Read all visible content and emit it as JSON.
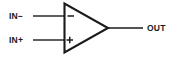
{
  "diagram": {
    "type": "schematic-symbol",
    "component": "operational-amplifier",
    "stroke_color": "#1a1a1a",
    "background_color": "#ffffff",
    "labels": {
      "inverting_input": "IN−",
      "noninverting_input": "IN+",
      "output": "OUT"
    },
    "terminal_marks": {
      "inverting": "−",
      "noninverting": "+"
    }
  }
}
